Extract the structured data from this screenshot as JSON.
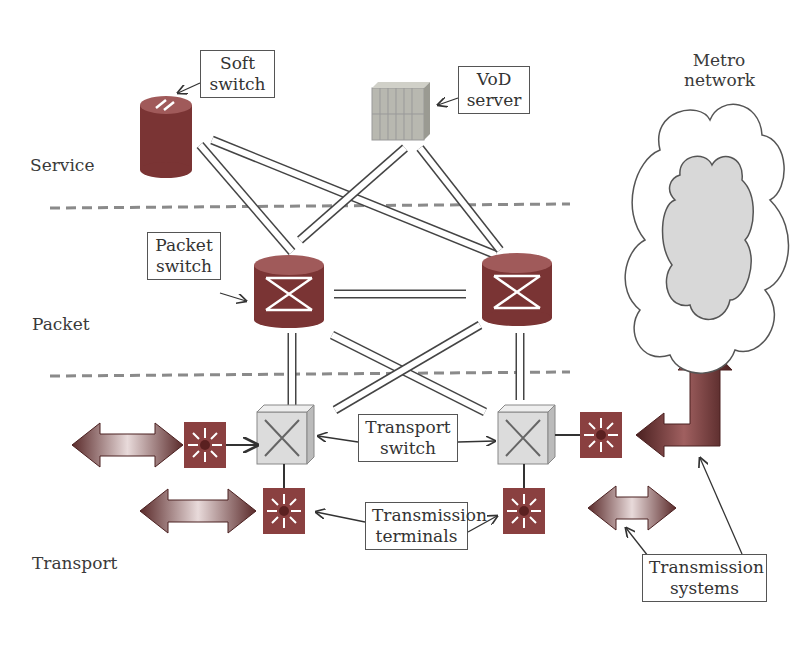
{
  "layers": {
    "service": "Service",
    "packet": "Packet",
    "transport": "Transport"
  },
  "callouts": {
    "soft_switch": [
      "Soft",
      "switch"
    ],
    "vod_server": [
      "VoD",
      "server"
    ],
    "packet_switch": [
      "Packet",
      "switch"
    ],
    "transport_switch": [
      "Transport",
      "switch"
    ],
    "transmission_terminals": [
      "Transmission",
      "terminals"
    ],
    "transmission_systems": [
      "Transmission",
      "systems"
    ]
  },
  "cloud_label": [
    "Metro",
    "network"
  ],
  "colors": {
    "device_red": "#8a3a3a",
    "device_top": "#a86060",
    "transport_switch": "#dcdcdc",
    "cloud_inner": "#d8d8d8",
    "dashed_line": "#8a8a8a",
    "server": "#b8b8b0"
  }
}
